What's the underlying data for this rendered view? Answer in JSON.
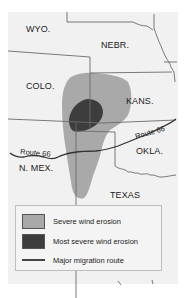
{
  "map": {
    "states": [
      {
        "id": "wyo",
        "label": "WYO."
      },
      {
        "id": "nebr",
        "label": "NEBR."
      },
      {
        "id": "colo",
        "label": "COLO."
      },
      {
        "id": "kans",
        "label": "KANS."
      },
      {
        "id": "okla",
        "label": "OKLA."
      },
      {
        "id": "n-mex",
        "label": "N. MEX."
      },
      {
        "id": "texas",
        "label": "TEXAS"
      }
    ],
    "routes": [
      {
        "label": "Route 66"
      },
      {
        "label": "Route 66"
      }
    ]
  },
  "legend": {
    "items": [
      {
        "label": "Severe wind erosion",
        "color": "#a9a9a9"
      },
      {
        "label": "Most severe wind erosion",
        "color": "#3d3d3d"
      },
      {
        "label": "Major migration route",
        "color": "#444444"
      }
    ]
  },
  "colors": {
    "background": "#f1f1f1",
    "severe": "#a9a9a9",
    "most_severe": "#3d3d3d",
    "border": "#6b6b6b"
  }
}
